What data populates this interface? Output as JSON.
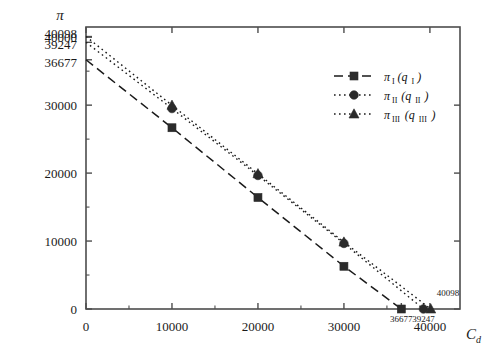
{
  "chart_data": {
    "type": "line",
    "title": "",
    "xlabel": "C_d",
    "ylabel": "π",
    "xlim": [
      0,
      43500
    ],
    "ylim": [
      0,
      41500
    ],
    "grid": false,
    "legend_position": "upper-right",
    "x_ticks": [
      0,
      10000,
      20000,
      30000,
      40000
    ],
    "x_tick_labels": [
      "0",
      "10000",
      "20000",
      "30000",
      "40000"
    ],
    "x_minor_ticks": [
      5000,
      15000,
      25000,
      35000
    ],
    "y_ticks": [
      0,
      10000,
      20000,
      30000
    ],
    "y_tick_labels": [
      "0",
      "10000",
      "20000",
      "30000"
    ],
    "y_minor_ticks": [
      5000,
      15000,
      25000,
      35000
    ],
    "y_special_ticks": [
      {
        "value": 40098,
        "label": "40098"
      },
      {
        "value": 40000,
        "label": "40000"
      },
      {
        "value": 39247,
        "label": "39247"
      },
      {
        "value": 36677,
        "label": "36677"
      }
    ],
    "x_special_ticks": [
      {
        "value": 36677,
        "label": "36677"
      },
      {
        "value": 39247,
        "label": "39247"
      }
    ],
    "annotations": [
      {
        "text": "40098",
        "x": 40098,
        "y": 1900
      }
    ],
    "series": [
      {
        "name": "π_I(q_I)",
        "legend_label": "π",
        "legend_sub": "I",
        "legend_arg": "q",
        "legend_arg_sub": "I",
        "linestyle": "dashed",
        "marker": "square",
        "color": "#1a1a1a",
        "x": [
          0,
          10000,
          20000,
          30000,
          36677
        ],
        "y": [
          36677,
          26674,
          16408,
          6287,
          0
        ],
        "x_intercept": 36677,
        "y_intercept": 36677
      },
      {
        "name": "π_II(q_II)",
        "legend_label": "π",
        "legend_sub": "II",
        "legend_arg": "q",
        "legend_arg_sub": "II",
        "linestyle": "dotted",
        "marker": "circle",
        "color": "#1a1a1a",
        "x": [
          0,
          10000,
          20000,
          30000,
          39247
        ],
        "y": [
          39247,
          29500,
          19650,
          9650,
          0
        ],
        "x_intercept": 39247,
        "y_intercept": 39247
      },
      {
        "name": "π_III(q_III)",
        "legend_label": "π",
        "legend_sub": "III",
        "legend_arg": "q",
        "legend_arg_sub": "III",
        "linestyle": "dotted",
        "marker": "triangle",
        "color": "#1a1a1a",
        "x": [
          0,
          10000,
          20000,
          30000,
          40098
        ],
        "y": [
          40098,
          29980,
          19900,
          9850,
          0
        ],
        "x_intercept": 40098,
        "y_intercept": 40098
      }
    ]
  },
  "legend": {
    "entries": [
      {
        "label": "π",
        "sub": "I",
        "arg": "q",
        "arg_sub": "I"
      },
      {
        "label": "π",
        "sub": "II",
        "arg": "q",
        "arg_sub": "II"
      },
      {
        "label": "π",
        "sub": "III",
        "arg": "q",
        "arg_sub": "III"
      }
    ]
  },
  "axes": {
    "y_axis_title": "π",
    "x_axis_title": "C",
    "x_axis_title_sub": "d"
  }
}
